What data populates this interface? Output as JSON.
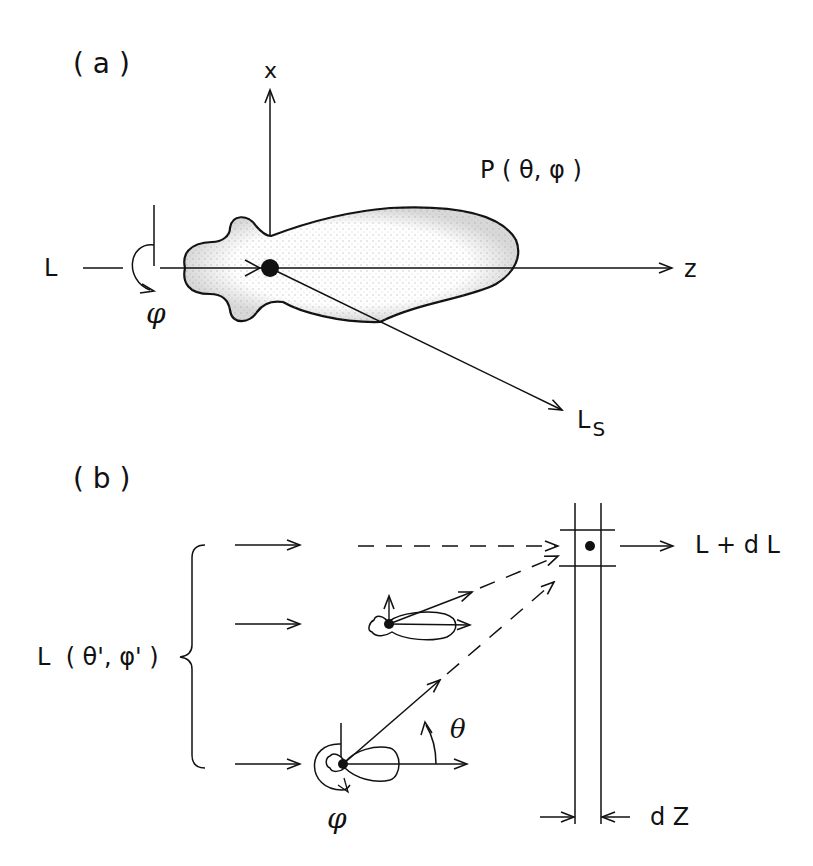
{
  "figure": {
    "panel_a": {
      "label": "( a )",
      "axis_x_label": "x",
      "axis_z_label": "z",
      "incident_label": "L",
      "phi_label": "φ",
      "phase_function_label": "P ( θ, φ )",
      "scattered_label": "L",
      "scattered_subscript": "S"
    },
    "panel_b": {
      "label": "( b )",
      "incident_label": "L  ( θ', φ' )",
      "output_label": "L + d L",
      "theta_label": "θ",
      "phi_label": "φ",
      "thickness_label": "d Z"
    },
    "colors": {
      "ink": "#111111",
      "stipple": "#9a9a9a",
      "background": "#ffffff"
    }
  }
}
